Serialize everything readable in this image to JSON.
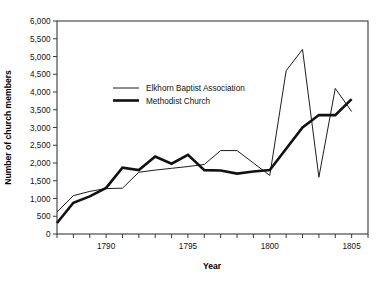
{
  "chart_data": {
    "type": "line",
    "title": "",
    "xlabel": "Year",
    "ylabel": "Number of church members",
    "xlim": [
      1787,
      1806
    ],
    "ylim": [
      0,
      6000
    ],
    "grid": false,
    "legend_position": "inside-upper-left",
    "x_ticks_every": 1,
    "y_ticks_every": 500,
    "xticklabels": [
      "1790",
      "1795",
      "1800",
      "1805"
    ],
    "xticklabel_values": [
      1790,
      1795,
      1800,
      1805
    ],
    "yticklabels": [
      "0",
      "500",
      "1,000",
      "1,500",
      "2,000",
      "2,500",
      "3,000",
      "3,500",
      "4,000",
      "4,500",
      "5,000",
      "5,500",
      "6,000"
    ],
    "yticklabel_values": [
      0,
      500,
      1000,
      1500,
      2000,
      2500,
      3000,
      3500,
      4000,
      4500,
      5000,
      5500,
      6000
    ],
    "x": [
      1787,
      1788,
      1789,
      1790,
      1791,
      1792,
      1793,
      1794,
      1795,
      1796,
      1797,
      1798,
      1799,
      1800,
      1801,
      1802,
      1803,
      1804,
      1805,
      1806
    ],
    "series": [
      {
        "name": "Elkhorn Baptist Association",
        "style": "thin",
        "color": "#1d1d1d",
        "values": [
          620,
          1080,
          1200,
          1280,
          1290,
          1740,
          1800,
          1850,
          1900,
          1960,
          2350,
          2350,
          2000,
          1650,
          4600,
          5200,
          1600,
          4100,
          3450,
          null
        ]
      },
      {
        "name": "Methodist Church",
        "style": "thick",
        "color": "#111111",
        "values": [
          310,
          880,
          1060,
          1300,
          1870,
          1800,
          2180,
          1980,
          2230,
          1800,
          1790,
          1700,
          1760,
          1800,
          2400,
          3000,
          3350,
          3350,
          3800,
          null
        ]
      }
    ]
  },
  "legend": {
    "entries": [
      {
        "label": "Elkhorn Baptist Association"
      },
      {
        "label": "Methodist Church"
      }
    ]
  },
  "axes": {
    "x_title": "Year",
    "y_title": "Number of church members"
  }
}
